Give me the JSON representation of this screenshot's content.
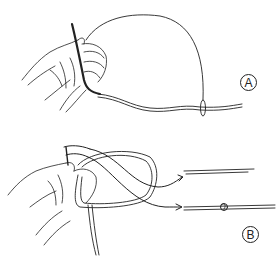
{
  "figure": {
    "colors": {
      "ink": "#222222",
      "background": "#ffffff"
    },
    "panels": [
      {
        "id": "A",
        "label": "A",
        "content": "Hand holding line with a large loop, tag end passing through a small loop on the standing line"
      },
      {
        "id": "B",
        "label": "B",
        "content": "Hand wrapping line into a loop; arrows point to separate line ends and a finished knot"
      }
    ]
  }
}
